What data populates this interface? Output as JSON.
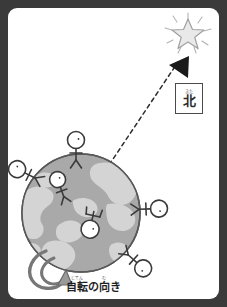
{
  "figure": {
    "kind": "science-illustration",
    "frame_color": "#3a3a3a",
    "paper_color": "#ffffff"
  },
  "labels": {
    "north_box": {
      "furigana": "きた",
      "kanji": "北",
      "border_color": "#4a4a4a"
    },
    "rotation_caption": {
      "part1_furigana": "じてん",
      "part1_kanji": "自転",
      "particle": "の",
      "part2_furigana": "む",
      "part2_kanji": "向",
      "tail": "き",
      "full_text": "自転の向き"
    }
  },
  "earth": {
    "center_x": 73,
    "center_y": 205,
    "radius": 59,
    "ocean_color": "#a9a9a9",
    "land_color": "#cfcfcf",
    "outline_color": "#555555"
  },
  "star": {
    "name": "polaris-star-icon",
    "center_x": 180,
    "center_y": 25,
    "fill": "#e8e8e8",
    "stroke": "#9a9a9a",
    "ray_count": 10
  },
  "arrow": {
    "name": "axis-pointer-arrow",
    "fill": "#1a1a1a",
    "tip_x": 161,
    "tip_y": 57
  },
  "axis_line": {
    "name": "earth-axis-dashed-line",
    "x1": 97,
    "y1": 163,
    "x2": 172,
    "y2": 52,
    "style": "dashed",
    "color": "#2a2a2a"
  },
  "rotation_arrow": {
    "name": "rotation-direction-arrow",
    "color": "#6f6f6f",
    "direction": "counter-clockwise"
  },
  "people": [
    {
      "id": "person-north-pole",
      "x": 68,
      "y": 142,
      "rotation": 0
    },
    {
      "id": "person-upper-left",
      "x": 18,
      "y": 165,
      "rotation": -62
    },
    {
      "id": "person-inner-upper-left",
      "x": 53,
      "y": 180,
      "rotation": -22
    },
    {
      "id": "person-inner-lower-center",
      "x": 80,
      "y": 228,
      "rotation": 14
    },
    {
      "id": "person-right",
      "x": 139,
      "y": 200,
      "rotation": 86
    },
    {
      "id": "person-lower-right",
      "x": 126,
      "y": 252,
      "rotation": 130
    }
  ]
}
